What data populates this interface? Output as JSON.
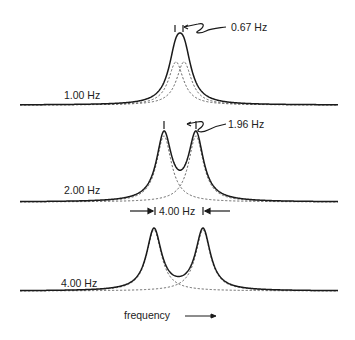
{
  "figure": {
    "panels": [
      {
        "coupling_label": "1.00 Hz",
        "splitting_label": "0.67 Hz",
        "line_width": 1.0,
        "peak_separation": 1.0
      },
      {
        "coupling_label": "2.00 Hz",
        "splitting_label": "1.96 Hz",
        "line_width": 1.0,
        "peak_separation": 2.0
      },
      {
        "coupling_label": "4.00 Hz",
        "splitting_label": "4.00 Hz",
        "line_width": 1.0,
        "peak_separation": 4.0
      }
    ],
    "x_axis_label": "frequency",
    "legend": {
      "solid": "observed sum spectrum",
      "dashed": "individual Lorentzian components"
    },
    "colors": {
      "line": "#1a1a1a",
      "dashed": "#555555",
      "background": "#ffffff"
    }
  }
}
